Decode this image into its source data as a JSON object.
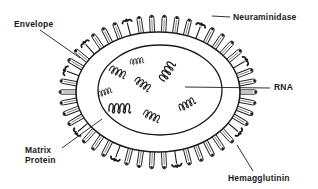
{
  "labels": {
    "envelope": "Envelope",
    "neuraminidase": "Neuraminidase",
    "rna": "RNA",
    "matrix_line1": "Matrix",
    "matrix_line2": "Protein",
    "hemagglutinin": "Hemagglutinin"
  },
  "components": [
    {
      "name": "envelope",
      "label": "Envelope"
    },
    {
      "name": "neuraminidase",
      "label": "Neuraminidase",
      "shape": "mushroom spike"
    },
    {
      "name": "hemagglutinin",
      "label": "Hemagglutinin",
      "shape": "rod spike"
    },
    {
      "name": "matrix-protein",
      "label": "Matrix Protein"
    },
    {
      "name": "rna",
      "label": "RNA",
      "segment_count": 8
    }
  ],
  "colors": {
    "ink": "#1a1a1a",
    "background": "#ffffff"
  }
}
